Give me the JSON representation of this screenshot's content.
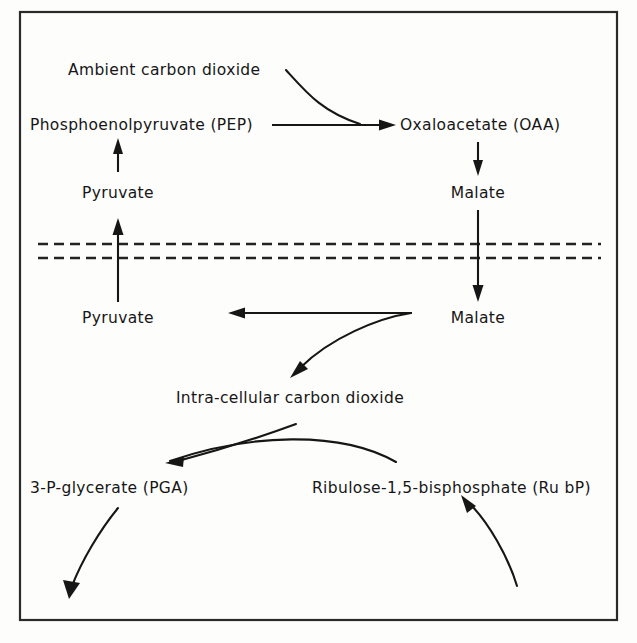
{
  "diagram": {
    "frame": {
      "x": 20,
      "y": 12,
      "width": 597,
      "height": 608,
      "stroke": "#2a2a2a"
    },
    "ink_color": "#161616",
    "background": "#fdfdfc",
    "membrane": {
      "name": "cell-membrane",
      "style": "dashed-double-line",
      "line1_y": 244,
      "line2_y": 258,
      "x_start": 38,
      "x_end": 601,
      "dash": "10 6",
      "color": "#232323"
    },
    "nodes": [
      {
        "id": "ambient-co2",
        "label": "Ambient carbon dioxide",
        "x": 68,
        "y": 70,
        "anchor": "start"
      },
      {
        "id": "pep",
        "label": "Phosphoenolpyruvate (PEP)",
        "x": 30,
        "y": 125,
        "anchor": "start"
      },
      {
        "id": "oaa",
        "label": "Oxaloacetate (OAA)",
        "x": 400,
        "y": 125,
        "anchor": "start"
      },
      {
        "id": "pyruvate-upper",
        "label": "Pyruvate",
        "x": 118,
        "y": 193,
        "anchor": "middle"
      },
      {
        "id": "malate-upper",
        "label": "Malate",
        "x": 478,
        "y": 193,
        "anchor": "middle"
      },
      {
        "id": "pyruvate-lower",
        "label": "Pyruvate",
        "x": 118,
        "y": 318,
        "anchor": "middle"
      },
      {
        "id": "malate-lower",
        "label": "Malate",
        "x": 478,
        "y": 318,
        "anchor": "middle"
      },
      {
        "id": "intra-co2",
        "label": "Intra-cellular carbon dioxide",
        "x": 290,
        "y": 398,
        "anchor": "middle"
      },
      {
        "id": "pga",
        "label": "3-P-glycerate (PGA)",
        "x": 30,
        "y": 488,
        "anchor": "start"
      },
      {
        "id": "rubp",
        "label": "Ribulose-1,5-bisphosphate (Ru bP)",
        "x": 312,
        "y": 488,
        "anchor": "start"
      }
    ],
    "arrows": [
      {
        "id": "arrow-co2-to-oaa",
        "from": "ambient-co2",
        "to": "oaa",
        "shape": "curve-down-right"
      },
      {
        "id": "arrow-pep-to-oaa",
        "from": "pep",
        "to": "oaa",
        "shape": "straight-right"
      },
      {
        "id": "arrow-pyruvate-to-pep",
        "from": "pyruvate-upper",
        "to": "pep",
        "shape": "straight-up"
      },
      {
        "id": "arrow-oaa-to-malate",
        "from": "oaa",
        "to": "malate-upper",
        "shape": "straight-down"
      },
      {
        "id": "arrow-pyruvate-transport",
        "from": "pyruvate-lower",
        "to": "pyruvate-upper",
        "shape": "straight-up-through-membrane"
      },
      {
        "id": "arrow-malate-transport",
        "from": "malate-upper",
        "to": "malate-lower",
        "shape": "straight-down-through-membrane"
      },
      {
        "id": "arrow-malate-to-pyruvate",
        "from": "malate-lower",
        "to": "pyruvate-lower",
        "shape": "straight-left"
      },
      {
        "id": "arrow-malate-to-co2",
        "from": "malate-lower",
        "to": "intra-co2",
        "shape": "curve-down-left"
      },
      {
        "id": "arrow-co2-to-pga",
        "from": "intra-co2",
        "to": "pga",
        "shape": "curve-down-left"
      },
      {
        "id": "arrow-rubp-to-pga",
        "from": "rubp",
        "to": "pga",
        "shape": "arc-left"
      },
      {
        "id": "arrow-pga-out",
        "from": "pga",
        "to": "",
        "shape": "curve-down-left-open"
      },
      {
        "id": "arrow-in-to-rubp",
        "from": "",
        "to": "rubp",
        "shape": "curve-up-left-open"
      }
    ]
  }
}
